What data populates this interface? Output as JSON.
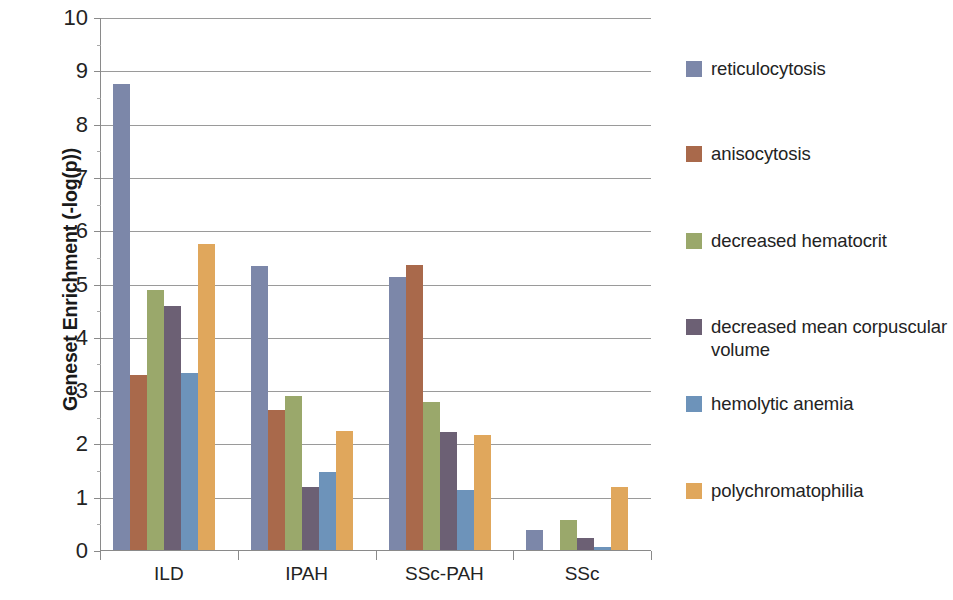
{
  "chart_data": {
    "type": "bar",
    "title": "",
    "subtitle": "",
    "xlabel": "",
    "ylabel": "Geneset Enrichment (-log(p))",
    "categories": [
      "ILD",
      "IPAH",
      "SSc-PAH",
      "SSc"
    ],
    "ylim": [
      0,
      10
    ],
    "y_ticks": [
      0,
      1,
      2,
      3,
      4,
      5,
      6,
      7,
      8,
      9,
      10
    ],
    "y_tick_labels": [
      "0",
      "1",
      "2",
      "3",
      "4",
      "5",
      "6",
      "7",
      "8",
      "9",
      "10"
    ],
    "grid": true,
    "grid_axis": "y",
    "legend_position": "right",
    "series": [
      {
        "name": "reticulocytosis",
        "color": "#7c87a9",
        "values": [
          8.75,
          5.32,
          5.12,
          0.38
        ]
      },
      {
        "name": "anisocytosis",
        "color": "#a9694b",
        "values": [
          3.28,
          2.63,
          5.35,
          0.0
        ]
      },
      {
        "name": "decreased hematocrit",
        "color": "#9aa86b",
        "values": [
          4.87,
          2.89,
          2.78,
          0.57
        ]
      },
      {
        "name": "decreased mean corpuscular volume",
        "color": "#6c6074",
        "values": [
          4.57,
          1.19,
          2.22,
          0.22
        ]
      },
      {
        "name": "hemolytic anemia",
        "color": "#6d93ba",
        "values": [
          3.32,
          1.47,
          1.12,
          0.06
        ]
      },
      {
        "name": "polychromatophilia",
        "color": "#e0a75c",
        "values": [
          5.75,
          2.24,
          2.15,
          1.18
        ]
      }
    ]
  },
  "legend": {
    "entries": [
      {
        "label": "reticulocytosis",
        "color": "#7c87a9"
      },
      {
        "label": "anisocytosis",
        "color": "#a9694b"
      },
      {
        "label": "decreased hematocrit",
        "color": "#9aa86b"
      },
      {
        "label": "decreased mean corpuscular volume",
        "color": "#6c6074"
      },
      {
        "label": "hemolytic anemia",
        "color": "#6d93ba"
      },
      {
        "label": "polychromatophilia",
        "color": "#e0a75c"
      }
    ]
  },
  "axis": {
    "y_title": "Geneset Enrichment (-log(p))"
  }
}
